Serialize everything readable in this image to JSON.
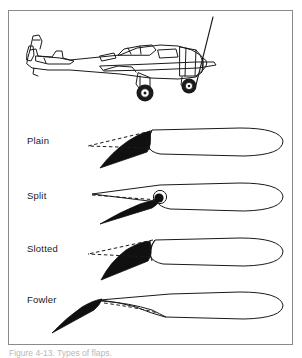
{
  "figure": {
    "caption": "Figure 4-13. Types of flaps.",
    "frame_color": "#8a8a8a",
    "ink_color": "#1a1a1a",
    "flap_fill_color": "#101010",
    "background_color": "#ffffff"
  },
  "aircraft": {
    "name": "single-engine-airplane-side-view",
    "description": "Side view line drawing of a low-wing single engine airplane with fixed main landing gear and propeller"
  },
  "flaps": [
    {
      "label": "Plain",
      "name": "plain-flap",
      "description": "Rear portion of airfoil rotates downward on a hinge; dashed lines show retracted position"
    },
    {
      "label": "Split",
      "name": "split-flap",
      "description": "Lower surface panel deflects down while upper surface remains fixed"
    },
    {
      "label": "Slotted",
      "name": "slotted-flap",
      "description": "Flap moves down and aft leaving a slot between wing and flap"
    },
    {
      "label": "Fowler",
      "name": "fowler-flap",
      "description": "Flap slides aft and down on tracks increasing wing area and camber"
    }
  ]
}
